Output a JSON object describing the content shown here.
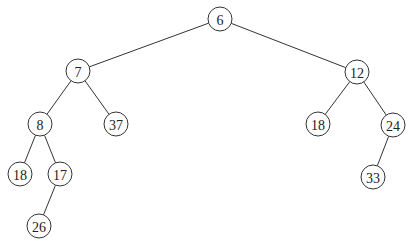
{
  "diagram": {
    "type": "binary-tree",
    "node_radius": 12,
    "colors": {
      "stroke": "#333333",
      "fill": "#ffffff",
      "text": "#222222"
    },
    "nodes": [
      {
        "id": "n6",
        "label": "6",
        "x": 220,
        "y": 19
      },
      {
        "id": "n7",
        "label": "7",
        "x": 78,
        "y": 71
      },
      {
        "id": "n12",
        "label": "12",
        "x": 357,
        "y": 72
      },
      {
        "id": "n8",
        "label": "8",
        "x": 40,
        "y": 124
      },
      {
        "id": "n37",
        "label": "37",
        "x": 116,
        "y": 124
      },
      {
        "id": "n18r",
        "label": "18",
        "x": 318,
        "y": 124
      },
      {
        "id": "n24",
        "label": "24",
        "x": 393,
        "y": 125
      },
      {
        "id": "n18l",
        "label": "18",
        "x": 20,
        "y": 174
      },
      {
        "id": "n17",
        "label": "17",
        "x": 60,
        "y": 174
      },
      {
        "id": "n33",
        "label": "33",
        "x": 373,
        "y": 177
      },
      {
        "id": "n26",
        "label": "26",
        "x": 39,
        "y": 226
      }
    ],
    "edges": [
      {
        "from": "n6",
        "to": "n7"
      },
      {
        "from": "n6",
        "to": "n12"
      },
      {
        "from": "n7",
        "to": "n8"
      },
      {
        "from": "n7",
        "to": "n37"
      },
      {
        "from": "n8",
        "to": "n18l"
      },
      {
        "from": "n8",
        "to": "n17"
      },
      {
        "from": "n17",
        "to": "n26"
      },
      {
        "from": "n12",
        "to": "n18r"
      },
      {
        "from": "n12",
        "to": "n24"
      },
      {
        "from": "n24",
        "to": "n33"
      }
    ]
  }
}
